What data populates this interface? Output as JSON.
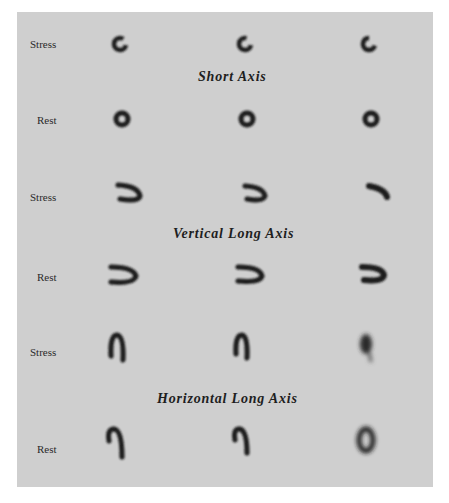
{
  "figure": {
    "sections": [
      {
        "title": "Short Axis",
        "rows": [
          {
            "label": "Stress",
            "images": 3,
            "shape": "ring"
          },
          {
            "label": "Rest",
            "images": 3,
            "shape": "ring"
          }
        ]
      },
      {
        "title": "Vertical Long Axis",
        "rows": [
          {
            "label": "Stress",
            "images": 3,
            "shape": "horseshoe-horizontal"
          },
          {
            "label": "Rest",
            "images": 3,
            "shape": "horseshoe-horizontal"
          }
        ]
      },
      {
        "title": "Horizontal Long Axis",
        "rows": [
          {
            "label": "Stress",
            "images": 3,
            "shape": "horseshoe-vertical"
          },
          {
            "label": "Rest",
            "images": 3,
            "shape": "horseshoe-vertical"
          }
        ]
      }
    ],
    "colors": {
      "background": "#cfcfcf",
      "uptake": "#1a1a1a",
      "text": "#2a2a2a"
    }
  }
}
